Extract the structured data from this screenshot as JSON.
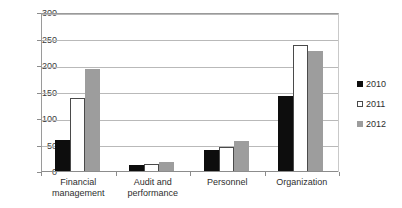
{
  "chart_data": {
    "type": "bar",
    "title": "",
    "subtitle": "",
    "xlabel": "",
    "ylabel": "",
    "ylim": [
      0,
      300
    ],
    "ytick_step": 50,
    "yticks": [
      300,
      250,
      200,
      150,
      100,
      50,
      0
    ],
    "grid": true,
    "legend_position": "right",
    "categories": [
      "Financial\nmanagement",
      "Audit and\nperformance",
      "Personnel",
      "Organization"
    ],
    "series": [
      {
        "name": "2010",
        "color": "#0d0d0d",
        "values": [
          60,
          13,
          42,
          143
        ]
      },
      {
        "name": "2011",
        "color": "#ffffff",
        "values": [
          140,
          15,
          47,
          240
        ]
      },
      {
        "name": "2012",
        "color": "#9d9d9d",
        "values": [
          195,
          19,
          58,
          229
        ]
      }
    ]
  },
  "legend": {
    "items": [
      {
        "label": "2010",
        "swatch": "legend-swatch-black"
      },
      {
        "label": "2011",
        "swatch": "legend-swatch-white"
      },
      {
        "label": "2012",
        "swatch": "legend-swatch-gray"
      }
    ]
  },
  "axis": {
    "y_labels": [
      "300",
      "250",
      "200",
      "150",
      "100",
      "50",
      "0"
    ],
    "x_labels": [
      "Financial\nmanagement",
      "Audit and\nperformance",
      "Personnel",
      "Organization"
    ]
  },
  "colors": {
    "series_2010": "#0d0d0d",
    "series_2011": "#ffffff",
    "series_2012": "#9d9d9d",
    "gridline": "#b9b9b9",
    "axis": "#8c8c8c",
    "text": "#2e2e2e",
    "background": "#ffffff"
  }
}
